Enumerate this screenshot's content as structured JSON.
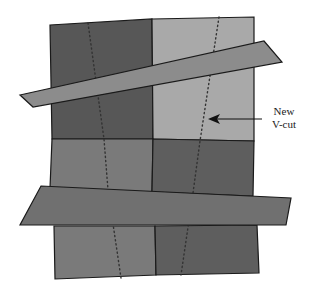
{
  "diagram": {
    "type": "paper-cut-illustration",
    "colors": {
      "dark": "#575757",
      "mid": "#7a7a7a",
      "light": "#a9a9a9",
      "strip": "#8c8c8c",
      "outline": "#1a1a1a",
      "dots": "#333333"
    },
    "annotation": {
      "line1": "New",
      "line2": "V-cut"
    }
  }
}
